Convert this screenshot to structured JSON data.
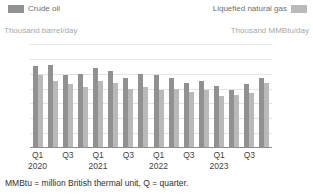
{
  "legend": {
    "left": {
      "label": "Crude oil",
      "color": "#919191",
      "icon": "legend-swatch"
    },
    "right": {
      "label": "Liquefied natural gas",
      "color": "#b9b9b9",
      "icon": "legend-swatch"
    }
  },
  "axis_units": {
    "left": "Thousand barrel/day",
    "right": "Thousand MMBtu/day"
  },
  "footnote": "MMBtu = million British thermal unit, Q = quarter.",
  "chart_data": {
    "type": "bar",
    "title": "",
    "xlabel": "",
    "ylabel": "Thousand barrel/day",
    "grid": true,
    "legend_position": "top",
    "categories": [
      "Q1 2020",
      "Q2 2020",
      "Q3 2020",
      "Q4 2020",
      "Q1 2021",
      "Q2 2021",
      "Q3 2021",
      "Q4 2021",
      "Q1 2022",
      "Q2 2022",
      "Q3 2022",
      "Q4 2022",
      "Q1 2023",
      "Q2 2023",
      "Q3 2023",
      "Q4 2023"
    ],
    "quarter_ticks": [
      "Q1",
      "Q3",
      "Q1",
      "Q3",
      "Q1",
      "Q3",
      "Q1",
      "Q3"
    ],
    "year_ticks": [
      "2020",
      "",
      "2021",
      "",
      "2022",
      "",
      "2023",
      ""
    ],
    "axes": {
      "left": {
        "label": "Thousand barrel/day",
        "ticks": [
          "0",
          "20",
          "40",
          "60",
          "80",
          "100",
          "120",
          "140"
        ],
        "min": 0,
        "max": 140
      },
      "right": {
        "label": "Thousand MMBtu/day",
        "ticks": [
          "0",
          "200",
          "400",
          "600",
          "800",
          "1,000",
          "1,200",
          "1,400"
        ],
        "min": 0,
        "max": 1400
      }
    },
    "series": [
      {
        "name": "Crude oil",
        "axis": "left",
        "color": "#919191",
        "values": [
          110,
          112,
          98,
          100,
          108,
          104,
          94,
          100,
          98,
          94,
          88,
          90,
          84,
          78,
          86,
          94
        ]
      },
      {
        "name": "Liquefied natural gas",
        "axis": "right",
        "color": "#b9b9b9",
        "values": [
          980,
          900,
          860,
          820,
          900,
          880,
          800,
          820,
          780,
          800,
          760,
          780,
          700,
          720,
          740,
          880
        ]
      }
    ]
  }
}
